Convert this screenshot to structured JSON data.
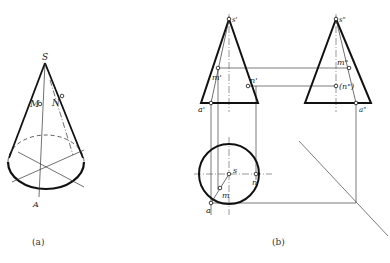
{
  "figure_a": {
    "caption": "(a)",
    "labels": {
      "apex": "S",
      "point_m": "M",
      "point_n": "N",
      "point_a": "A"
    }
  },
  "figure_b": {
    "caption": "(b)",
    "front_view": {
      "apex": "s'",
      "point_m": "m'",
      "point_n": "n'",
      "point_a": "a'"
    },
    "side_view": {
      "apex": "s\"",
      "point_m": "m\"",
      "point_n": "(n\")",
      "point_a": "a\""
    },
    "top_view": {
      "center": "s",
      "point_m": "m",
      "point_n": "n",
      "point_a": "a"
    }
  },
  "colors": {
    "outline": "#1a1a1a",
    "thin": "#444444",
    "background": "#ffffff"
  }
}
